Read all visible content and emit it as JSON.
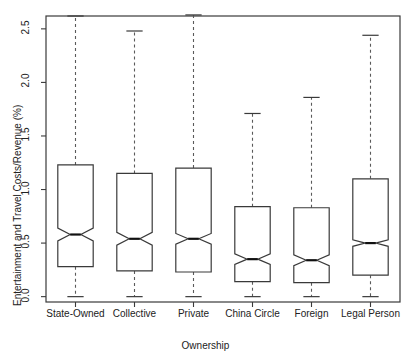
{
  "chart_data": {
    "type": "box",
    "title": "",
    "xlabel": "Ownership",
    "ylabel": "Entertainment and Travel Costs/Revenue (%)",
    "ylim": [
      -0.05,
      2.62
    ],
    "yticks": [
      0.0,
      0.5,
      1.0,
      1.5,
      2.0,
      2.5
    ],
    "ytick_labels": [
      "0.0",
      "0.5",
      "1.0",
      "1.5",
      "2.0",
      "2.5"
    ],
    "grid": false,
    "legend": "none",
    "notched": true,
    "categories": [
      "State-Owned",
      "Collective",
      "Private",
      "China Circle",
      "Foreign",
      "Legal Person"
    ],
    "boxes": [
      {
        "category": "State-Owned",
        "whisker_low": 0.0,
        "q1": 0.28,
        "median": 0.58,
        "q3": 1.23,
        "whisker_high": 2.62,
        "notch_low": 0.52,
        "notch_high": 0.64
      },
      {
        "category": "Collective",
        "whisker_low": 0.0,
        "q1": 0.24,
        "median": 0.54,
        "q3": 1.15,
        "whisker_high": 2.48,
        "notch_low": 0.48,
        "notch_high": 0.6
      },
      {
        "category": "Private",
        "whisker_low": 0.0,
        "q1": 0.23,
        "median": 0.54,
        "q3": 1.2,
        "whisker_high": 2.63,
        "notch_low": 0.49,
        "notch_high": 0.59
      },
      {
        "category": "China Circle",
        "whisker_low": 0.0,
        "q1": 0.14,
        "median": 0.35,
        "q3": 0.84,
        "whisker_high": 1.71,
        "notch_low": 0.3,
        "notch_high": 0.4
      },
      {
        "category": "Foreign",
        "whisker_low": 0.0,
        "q1": 0.13,
        "median": 0.34,
        "q3": 0.83,
        "whisker_high": 1.86,
        "notch_low": 0.29,
        "notch_high": 0.39
      },
      {
        "category": "Legal Person",
        "whisker_low": 0.0,
        "q1": 0.2,
        "median": 0.5,
        "q3": 1.1,
        "whisker_high": 2.44,
        "notch_low": 0.47,
        "notch_high": 0.53
      }
    ],
    "colors": {
      "line": "#3a3a3a",
      "median": "#111111",
      "whisker": "#5a5a5a",
      "frame": "#3a3a3a",
      "background": "#ffffff",
      "text": "#222222"
    }
  }
}
